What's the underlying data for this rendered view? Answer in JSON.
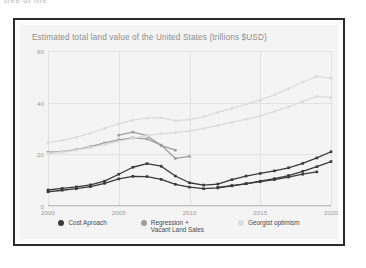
{
  "clipped_caption": "tree of life",
  "chart_title": "Estimated total land value of the United States (trillions $USD)",
  "colors": {
    "cost_approach": "#3a3a3a",
    "regression": "#9e9e9e",
    "georgist": "#dcdcdc",
    "grid": "#e2e2e2",
    "axis_text": "#9d9d9d",
    "title_text": "#8e8e8e",
    "card_border": "#2b2b2b",
    "panel_bg": "#f4f4f4"
  },
  "legend": [
    {
      "label": "Cost Aproach",
      "swatch": "#3a3a3a"
    },
    {
      "label": "Regression +\nVacant Land Sales",
      "swatch": "#9e9e9e"
    },
    {
      "label": "Georgist optimism",
      "swatch": "#dcdcdc"
    }
  ],
  "chart_data": {
    "type": "line",
    "title": "Estimated total land value of the United States (trillions $USD)",
    "xlabel": "",
    "ylabel": "",
    "xlim": [
      2000,
      2020
    ],
    "ylim": [
      0,
      60
    ],
    "yticks": [
      0,
      20,
      40,
      60
    ],
    "xticks": [
      2000,
      2005,
      2010,
      2015,
      2020
    ],
    "grid": true,
    "legend_position": "bottom",
    "markers": true,
    "series": [
      {
        "name": "Cost Aproach (upper)",
        "group": "Cost Aproach",
        "color": "#3a3a3a",
        "x": [
          2000,
          2001,
          2002,
          2003,
          2004,
          2005,
          2006,
          2007,
          2008,
          2009,
          2010,
          2011,
          2012,
          2013,
          2014,
          2015,
          2016,
          2017,
          2018,
          2019,
          2020
        ],
        "values": [
          6.2,
          6.8,
          7.4,
          8.2,
          9.6,
          12.3,
          15.0,
          16.4,
          15.4,
          11.6,
          9.0,
          8.1,
          8.5,
          10.2,
          11.6,
          12.6,
          13.6,
          14.8,
          16.5,
          18.6,
          21.0
        ]
      },
      {
        "name": "Cost Aproach (lower)",
        "group": "Cost Aproach",
        "color": "#3a3a3a",
        "x": [
          2000,
          2001,
          2002,
          2003,
          2004,
          2005,
          2006,
          2007,
          2008,
          2009,
          2010,
          2011,
          2012,
          2013,
          2014,
          2015,
          2016,
          2017,
          2018,
          2019,
          2020
        ],
        "values": [
          5.5,
          6.1,
          6.7,
          7.5,
          8.8,
          10.5,
          11.5,
          11.4,
          10.3,
          8.4,
          7.3,
          6.7,
          7.0,
          7.8,
          8.7,
          9.6,
          10.6,
          11.8,
          13.4,
          15.2,
          17.2
        ]
      },
      {
        "name": "Cost Aproach (mid)",
        "group": "Cost Aproach",
        "color": "#3a3a3a",
        "x": [
          2012,
          2013,
          2014,
          2015,
          2016,
          2017,
          2018,
          2019
        ],
        "values": [
          7.2,
          7.9,
          8.6,
          9.4,
          10.2,
          11.2,
          12.3,
          13.2
        ]
      },
      {
        "name": "Regression + Vacant Land Sales (upper)",
        "group": "Regression + Vacant Land Sales",
        "color": "#9e9e9e",
        "x": [
          2005,
          2006,
          2007,
          2008,
          2009
        ],
        "values": [
          27.4,
          28.6,
          27.2,
          23.4,
          21.6
        ]
      },
      {
        "name": "Regression + Vacant Land Sales (lower)",
        "group": "Regression + Vacant Land Sales",
        "color": "#9e9e9e",
        "x": [
          2000,
          2001,
          2002,
          2003,
          2004,
          2005,
          2006,
          2007,
          2008,
          2009,
          2010
        ],
        "values": [
          20.8,
          21.0,
          21.8,
          23.0,
          24.4,
          25.6,
          26.4,
          26.0,
          23.6,
          18.4,
          19.2
        ]
      },
      {
        "name": "Georgist optimism (upper)",
        "group": "Georgist optimism",
        "color": "#dcdcdc",
        "x": [
          2000,
          2001,
          2002,
          2003,
          2004,
          2005,
          2006,
          2007,
          2008,
          2009,
          2010,
          2011,
          2012,
          2013,
          2014,
          2015,
          2016,
          2017,
          2018,
          2019,
          2020
        ],
        "values": [
          24.6,
          25.4,
          26.6,
          28.2,
          30.0,
          31.8,
          33.2,
          34.0,
          34.2,
          33.0,
          33.4,
          34.6,
          36.2,
          37.8,
          39.4,
          41.0,
          43.0,
          45.4,
          48.0,
          50.2,
          49.4
        ]
      },
      {
        "name": "Georgist optimism (lower)",
        "group": "Georgist optimism",
        "color": "#dcdcdc",
        "x": [
          2000,
          2001,
          2002,
          2003,
          2004,
          2005,
          2006,
          2007,
          2008,
          2009,
          2010,
          2011,
          2012,
          2013,
          2014,
          2015,
          2016,
          2017,
          2018,
          2019,
          2020
        ],
        "values": [
          20.4,
          20.8,
          21.6,
          22.6,
          23.8,
          25.0,
          26.2,
          27.2,
          28.0,
          28.4,
          29.0,
          30.0,
          31.2,
          32.4,
          33.6,
          34.8,
          36.6,
          38.4,
          40.4,
          42.4,
          42.0
        ]
      }
    ]
  }
}
